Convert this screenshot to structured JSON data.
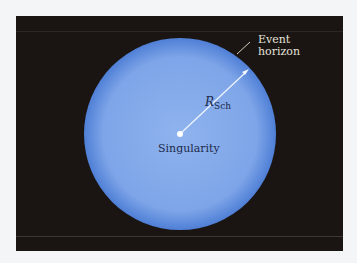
{
  "labels": {
    "event_horizon_line1": "Event",
    "event_horizon_line2": "horizon",
    "radius_symbol": "R",
    "radius_subscript": "Sch",
    "singularity": "Singularity"
  },
  "colors": {
    "background": "#1a1512",
    "sphere_center": "#8ab0ec",
    "sphere_edge": "#4f7fd6",
    "label_dark": "#1c2a4a",
    "label_light": "#e6e2dc"
  }
}
